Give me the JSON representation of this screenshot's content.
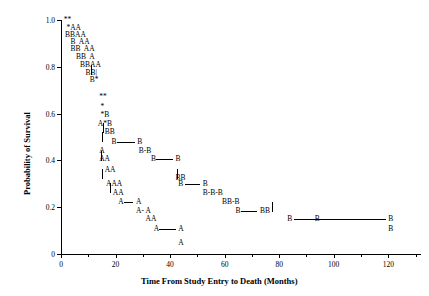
{
  "chart_data": {
    "type": "scatter",
    "title": "",
    "xlabel": "Time From Study Entry to Death (Months)",
    "ylabel": "Probability of Survival",
    "xlim": [
      0,
      132
    ],
    "ylim": [
      0,
      1.0
    ],
    "xticks": [
      0,
      20,
      40,
      60,
      80,
      100,
      120
    ],
    "xticklabels": [
      "0",
      "20",
      "40",
      "60",
      "80",
      "100",
      "120"
    ],
    "xminorticks": [
      10,
      30,
      50,
      70,
      90,
      110,
      130
    ],
    "yticks": [
      0,
      0.2,
      0.4,
      0.6,
      0.8,
      1.0
    ],
    "yticklabels": [
      "0",
      "0.2",
      "0.4",
      "0.6",
      "0.8",
      "1.0"
    ],
    "grid": false,
    "legend": "none",
    "marker_style": "text-characters",
    "series": [
      {
        "name": "A",
        "symbol": "A"
      },
      {
        "name": "B",
        "symbol": "B"
      },
      {
        "name": "overlap",
        "symbol": "*"
      },
      {
        "name": "censored",
        "symbol": "|"
      }
    ],
    "rows": [
      {
        "y": 1.0,
        "x": 1.0,
        "text": "**"
      },
      {
        "y": 0.965,
        "x": 2.0,
        "text": "*AA"
      },
      {
        "y": 0.935,
        "x": 1.5,
        "text": "BBAA"
      },
      {
        "y": 0.905,
        "x": 3.5,
        "text": "B  AA"
      },
      {
        "y": 0.875,
        "x": 3.5,
        "text": "BB  AA"
      },
      {
        "y": 0.84,
        "x": 5.5,
        "text": "BB  A"
      },
      {
        "y": 0.808,
        "x": 7.0,
        "text": "BBAA"
      },
      {
        "y": 0.775,
        "x": 9.0,
        "text": "BB|"
      },
      {
        "y": 0.742,
        "x": 10.5,
        "text": "B*"
      },
      {
        "y": 0.672,
        "x": 14.0,
        "text": "**"
      },
      {
        "y": 0.627,
        "x": 14.5,
        "text": "*"
      },
      {
        "y": 0.592,
        "x": 14.5,
        "text": "*B"
      },
      {
        "y": 0.557,
        "x": 13.5,
        "text": "A*B"
      },
      {
        "y": 0.522,
        "x": 16.0,
        "text": "BB"
      },
      {
        "y": 0.48,
        "x": 18.5,
        "text": "B"
      },
      {
        "y": 0.48,
        "x": 28.0,
        "text": "B"
      },
      {
        "y": 0.44,
        "x": 14.0,
        "text": "A"
      },
      {
        "y": 0.44,
        "x": 28.5,
        "text": "B-B"
      },
      {
        "y": 0.405,
        "x": 14.0,
        "text": "AA"
      },
      {
        "y": 0.405,
        "x": 33.0,
        "text": "B"
      },
      {
        "y": 0.405,
        "x": 42.0,
        "text": "B"
      },
      {
        "y": 0.36,
        "x": 16.0,
        "text": "AA"
      },
      {
        "y": 0.325,
        "x": 42.0,
        "text": "BB"
      },
      {
        "y": 0.3,
        "x": 16.5,
        "text": "AAA"
      },
      {
        "y": 0.3,
        "x": 43.0,
        "text": "B"
      },
      {
        "y": 0.3,
        "x": 52.0,
        "text": "B"
      },
      {
        "y": 0.262,
        "x": 19.0,
        "text": "AA"
      },
      {
        "y": 0.262,
        "x": 52.0,
        "text": "B-B-B"
      },
      {
        "y": 0.222,
        "x": 21.0,
        "text": "A"
      },
      {
        "y": 0.222,
        "x": 27.5,
        "text": "A"
      },
      {
        "y": 0.222,
        "x": 59.0,
        "text": "BB-B"
      },
      {
        "y": 0.185,
        "x": 27.5,
        "text": "A- A"
      },
      {
        "y": 0.185,
        "x": 64.0,
        "text": "B"
      },
      {
        "y": 0.185,
        "x": 73.0,
        "text": "BB"
      },
      {
        "y": 0.148,
        "x": 31.0,
        "text": "AA"
      },
      {
        "y": 0.148,
        "x": 83.0,
        "text": "B"
      },
      {
        "y": 0.148,
        "x": 93.0,
        "text": "B"
      },
      {
        "y": 0.148,
        "x": 120.0,
        "text": "B"
      },
      {
        "y": 0.105,
        "x": 34.0,
        "text": "A"
      },
      {
        "y": 0.105,
        "x": 43.0,
        "text": "A"
      },
      {
        "y": 0.105,
        "x": 120.0,
        "text": "B"
      },
      {
        "y": 0.048,
        "x": 43.0,
        "text": "A"
      }
    ],
    "connector_lines": [
      {
        "y": 0.48,
        "x0": 20.5,
        "x1": 27.0
      },
      {
        "y": 0.405,
        "x0": 35.0,
        "x1": 41.0
      },
      {
        "y": 0.3,
        "x0": 45.5,
        "x1": 51.0
      },
      {
        "y": 0.185,
        "x0": 66.0,
        "x1": 72.0
      },
      {
        "y": 0.148,
        "x0": 85.5,
        "x1": 119.0
      },
      {
        "y": 0.222,
        "x0": 23.0,
        "x1": 26.5
      },
      {
        "y": 0.105,
        "x0": 36.0,
        "x1": 42.0
      }
    ],
    "censor_ticks": [
      {
        "x": 15.5,
        "y": 0.54
      },
      {
        "x": 15.0,
        "y": 0.5
      },
      {
        "x": 11.0,
        "y": 0.787
      },
      {
        "x": 14.5,
        "y": 0.42
      },
      {
        "x": 15.0,
        "y": 0.34
      },
      {
        "x": 42.5,
        "y": 0.34
      },
      {
        "x": 18.0,
        "y": 0.282
      },
      {
        "x": 77.5,
        "y": 0.2
      }
    ]
  }
}
